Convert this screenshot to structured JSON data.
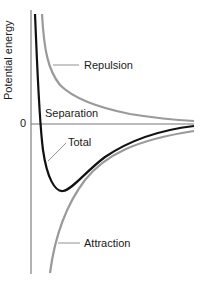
{
  "diagram": {
    "type": "potential-energy-curve",
    "y_axis_label": "Potential energy",
    "x_axis_label": "Separation",
    "zero_tick": "0",
    "curves": [
      {
        "name": "Repulsion",
        "label": "Repulsion",
        "color": "#9a9a9a"
      },
      {
        "name": "Total",
        "label": "Total",
        "color": "#111111"
      },
      {
        "name": "Attraction",
        "label": "Attraction",
        "color": "#9a9a9a"
      }
    ],
    "axis_color": "#666666"
  }
}
